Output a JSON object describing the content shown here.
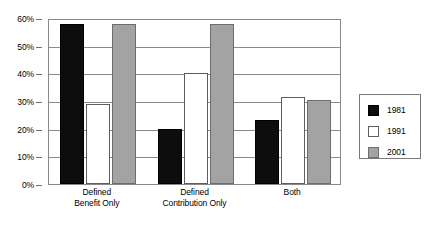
{
  "chart_data": {
    "type": "bar",
    "title": "",
    "subtitle": "",
    "xlabel": "",
    "ylabel": "",
    "categories": [
      "Defined Benefit Only",
      "Defined Contribution Only",
      "Both"
    ],
    "category_lines": [
      [
        "Defined",
        "Benefit Only"
      ],
      [
        "Defined",
        "Contribution Only"
      ],
      [
        "Both"
      ]
    ],
    "series": [
      {
        "name": "1981",
        "color": "#0d0d0d",
        "values": [
          58,
          20,
          23
        ]
      },
      {
        "name": "1991",
        "color": "#ffffff",
        "values": [
          29,
          40,
          31.5
        ]
      },
      {
        "name": "2001",
        "color": "#a3a3a3",
        "values": [
          58,
          58,
          30.5
        ]
      }
    ],
    "ylim": [
      0,
      60
    ],
    "ytick_values": [
      0,
      10,
      20,
      30,
      40,
      50,
      60
    ],
    "ytick_labels": [
      "0%",
      "10%",
      "20%",
      "30%",
      "40%",
      "50%",
      "60%"
    ],
    "grid": true,
    "grid_axis": "y",
    "legend_position": "right",
    "value_suffix": "%"
  },
  "legend": {
    "entries": [
      {
        "label": "1981",
        "swatch": "black-swatch"
      },
      {
        "label": "1991",
        "swatch": "white-swatch"
      },
      {
        "label": "2001",
        "swatch": "gray-swatch"
      }
    ]
  },
  "colors": {
    "series_1981": "#0d0d0d",
    "series_1991": "#ffffff",
    "series_2001": "#a3a3a3",
    "axis": "#8a8a8a",
    "background": "#ffffff"
  }
}
